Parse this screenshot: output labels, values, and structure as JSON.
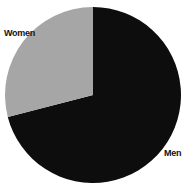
{
  "chart_data": {
    "type": "pie",
    "title": "",
    "categories": [
      "Men",
      "Women"
    ],
    "values": [
      71,
      29
    ],
    "colors": [
      "#0d0d0d",
      "#a6a6a6"
    ],
    "start_angle_deg": 0,
    "direction": "clockwise",
    "legend": "none",
    "labels_outside": true
  },
  "labels": {
    "women": "Women",
    "men": "Men"
  }
}
